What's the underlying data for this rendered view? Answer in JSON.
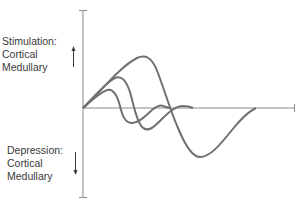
{
  "diagram": {
    "labels": {
      "stimulation": {
        "title": "Stimulation:",
        "line1": "Cortical",
        "line2": "Medullary"
      },
      "depression": {
        "title": "Depression:",
        "line1": "Cortical",
        "line2": "Medullary"
      }
    },
    "colors": {
      "axis": "#8a8a8a",
      "curve": "#707070",
      "text": "#3a3a3a"
    },
    "icons": {
      "up_arrow": "arrow-up-icon",
      "down_arrow": "arrow-down-icon"
    },
    "curves": [
      {
        "name": "short-response",
        "peak": [
          110,
          90
        ],
        "trough": [
          130,
          122
        ]
      },
      {
        "name": "medium-response",
        "peak": [
          117,
          77
        ],
        "trough": [
          142,
          130
        ]
      },
      {
        "name": "long-response",
        "peak": [
          137,
          58
        ],
        "trough": [
          199,
          157
        ]
      }
    ]
  }
}
